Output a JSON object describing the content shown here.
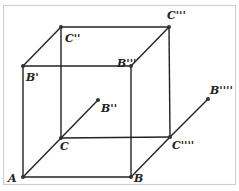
{
  "diagram": {
    "type": "geometric-cube-diagram",
    "colors": {
      "line": "#222222",
      "frame": "#cfcfcf",
      "background": "#ffffff"
    },
    "points": [
      {
        "id": "A",
        "label": "A",
        "x": 23,
        "y": 177,
        "lx": 8,
        "ly": 182
      },
      {
        "id": "B",
        "label": "B",
        "x": 131,
        "y": 177,
        "lx": 134,
        "ly": 182
      },
      {
        "id": "C",
        "label": "C",
        "x": 61,
        "y": 138,
        "lx": 60,
        "ly": 150
      },
      {
        "id": "C4",
        "label": "C''''",
        "x": 170,
        "y": 137,
        "lx": 172,
        "ly": 149
      },
      {
        "id": "Bp",
        "label": "B'",
        "x": 23,
        "y": 66,
        "lx": 26,
        "ly": 81
      },
      {
        "id": "B3",
        "label": "B'''",
        "x": 131,
        "y": 66,
        "lx": 117,
        "ly": 67
      },
      {
        "id": "C2",
        "label": "C''",
        "x": 61,
        "y": 27,
        "lx": 65,
        "ly": 42
      },
      {
        "id": "C3",
        "label": "C'''",
        "x": 169,
        "y": 27,
        "lx": 167,
        "ly": 19
      },
      {
        "id": "B2",
        "label": "B''",
        "x": 98,
        "y": 100,
        "lx": 101,
        "ly": 112
      },
      {
        "id": "B4",
        "label": "B''''",
        "x": 208,
        "y": 99,
        "lx": 210,
        "ly": 94
      }
    ],
    "edges": [
      [
        "A",
        "B"
      ],
      [
        "A",
        "Bp"
      ],
      [
        "A",
        "C"
      ],
      [
        "C",
        "B2"
      ],
      [
        "B",
        "B3"
      ],
      [
        "B",
        "C4"
      ],
      [
        "C4",
        "B4"
      ],
      [
        "Bp",
        "B3"
      ],
      [
        "Bp",
        "C2"
      ],
      [
        "C2",
        "C3"
      ],
      [
        "B3",
        "C3"
      ],
      [
        "C2",
        "C"
      ],
      [
        "C",
        "C4"
      ],
      [
        "C3",
        "C4"
      ]
    ]
  }
}
